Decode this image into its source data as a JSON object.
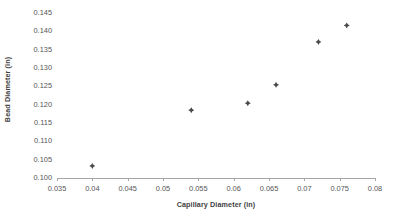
{
  "chart_data": {
    "type": "scatter",
    "title": "",
    "xlabel": "Capillary Diameter (in)",
    "ylabel": "Bead Diameter (in)",
    "xlim": [
      0.035,
      0.08
    ],
    "ylim": [
      0.1,
      0.145
    ],
    "xticks": [
      "0.035",
      "0.04",
      "0.045",
      "0.05",
      "0.055",
      "0.06",
      "0.065",
      "0.07",
      "0.075",
      "0.08"
    ],
    "xtick_values": [
      0.035,
      0.04,
      0.045,
      0.05,
      0.055,
      0.06,
      0.065,
      0.07,
      0.075,
      0.08
    ],
    "yticks": [
      "0.100",
      "0.105",
      "0.110",
      "0.115",
      "0.120",
      "0.125",
      "0.130",
      "0.135",
      "0.140",
      "0.145"
    ],
    "ytick_values": [
      0.1,
      0.105,
      0.11,
      0.115,
      0.12,
      0.125,
      0.13,
      0.135,
      0.14,
      0.145
    ],
    "grid": "horizontal",
    "legend": "none",
    "series": [
      {
        "name": "Bead Diameter",
        "marker": "diamond",
        "color": "#4a4a4a",
        "points": [
          {
            "x": 0.04,
            "y": 0.1033
          },
          {
            "x": 0.054,
            "y": 0.1185
          },
          {
            "x": 0.062,
            "y": 0.1204
          },
          {
            "x": 0.066,
            "y": 0.1254
          },
          {
            "x": 0.072,
            "y": 0.1371
          },
          {
            "x": 0.076,
            "y": 0.1416
          }
        ]
      }
    ]
  },
  "axes": {
    "x_title": "Capillary Diameter (in)",
    "y_title": "Bead Diameter (in)"
  },
  "colors": {
    "marker": "#4a4a4a",
    "gridline": "#b7b7b7",
    "axis": "#a6a6a6",
    "text": "#555555",
    "title_text": "#3f3f3f",
    "background": "#ffffff"
  }
}
